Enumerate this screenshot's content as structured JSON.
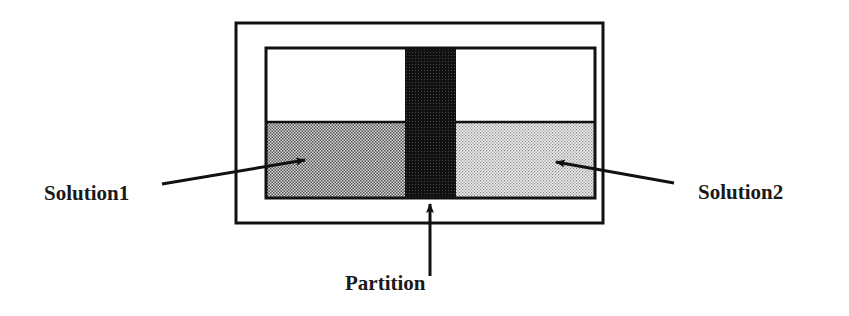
{
  "diagram": {
    "title": "",
    "labels": {
      "solution1": "Solution1",
      "solution2": "Solution2",
      "partition": "Partition"
    },
    "colors": {
      "line": "#111111",
      "solution1_fill": "#9a9a9a",
      "solution2_fill": "#cfcfcf",
      "partition_fill": "#141414",
      "background": "#ffffff"
    }
  }
}
